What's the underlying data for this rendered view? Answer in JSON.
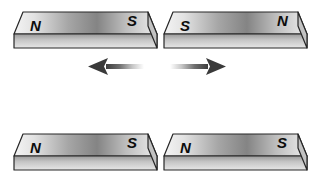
{
  "figure": {
    "name": "bar-magnet-pole-interaction-diagram",
    "background_color": "#ffffff",
    "width": 311,
    "height": 177
  },
  "palette": {
    "top_face_light": "#f2f2f2",
    "top_face_mid": "#9b9b9b",
    "top_face_dark": "#7d7d7d",
    "front_face_light": "#d9d9d9",
    "front_face_dark": "#8a8a8a",
    "end_face": "#c9c9c9",
    "outline": "#2b2b2b",
    "label_color": "#0d0d0d",
    "arrow_head": "#3d3d3d",
    "arrow_tail_fade": "#ffffff"
  },
  "magnets": [
    {
      "id": "magnet-top-left",
      "row": "top",
      "side": "left",
      "left_pole": "N",
      "right_pole": "S",
      "x": 14,
      "y": 8,
      "length": 134,
      "top_height": 26,
      "thickness": 14,
      "skew": 9
    },
    {
      "id": "magnet-top-right",
      "row": "top",
      "side": "right",
      "left_pole": "S",
      "right_pole": "N",
      "x": 164,
      "y": 8,
      "length": 134,
      "top_height": 26,
      "thickness": 14,
      "skew": 9
    },
    {
      "id": "magnet-bottom-left",
      "row": "bottom",
      "side": "left",
      "left_pole": "N",
      "right_pole": "S",
      "x": 14,
      "y": 130,
      "length": 134,
      "top_height": 26,
      "thickness": 14,
      "skew": 9
    },
    {
      "id": "magnet-bottom-right",
      "row": "bottom",
      "side": "right",
      "left_pole": "N",
      "right_pole": "S",
      "x": 164,
      "y": 130,
      "length": 134,
      "top_height": 26,
      "thickness": 14,
      "skew": 9
    }
  ],
  "arrows": [
    {
      "id": "arrow-left-repel",
      "direction": "left",
      "x": 88,
      "y": 58,
      "length": 52,
      "meaning": "repulsion-force-left"
    },
    {
      "id": "arrow-right-repel",
      "direction": "right",
      "x": 170,
      "y": 58,
      "length": 52,
      "meaning": "repulsion-force-right"
    }
  ]
}
